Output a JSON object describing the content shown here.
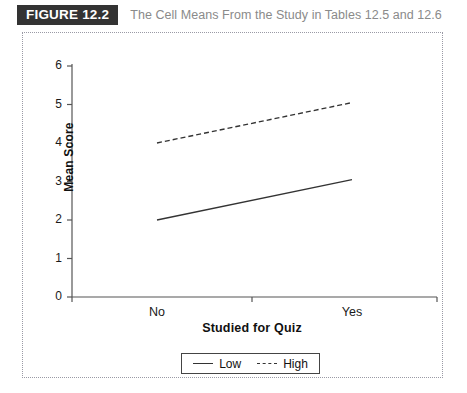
{
  "header": {
    "badge": "FIGURE 12.2",
    "caption": "The Cell Means From the Study in Tables 12.5 and 12.6"
  },
  "chart_data": {
    "type": "line",
    "title": "",
    "xlabel": "Studied for Quiz",
    "ylabel": "Mean Score",
    "categories": [
      "No",
      "Yes"
    ],
    "ylim": [
      0,
      6
    ],
    "yticks": [
      "0",
      "1",
      "2",
      "3",
      "4",
      "5",
      "6"
    ],
    "grid": false,
    "legend_position": "bottom",
    "series": [
      {
        "name": "Low",
        "values": [
          2.0,
          3.05
        ],
        "style": "solid",
        "color": "#333333"
      },
      {
        "name": "High",
        "values": [
          4.0,
          5.05
        ],
        "style": "dashed",
        "color": "#333333"
      }
    ]
  },
  "legend": {
    "entries": [
      {
        "label": "Low"
      },
      {
        "label": "High"
      }
    ]
  },
  "colors": {
    "badge_background": "#333333",
    "caption_text": "#8a8a8a",
    "axis": "#555555",
    "line": "#333333",
    "frame_border": "#9a9aa5"
  }
}
